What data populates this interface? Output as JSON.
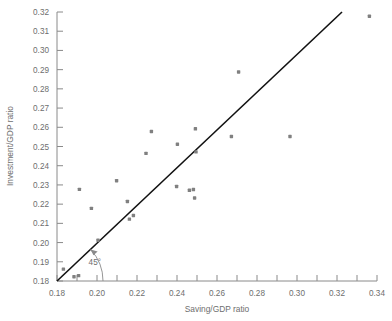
{
  "chart_data": {
    "type": "scatter",
    "title": "",
    "xlabel": "Saving/GDP ratio",
    "ylabel": "Investment/GDP ratio",
    "xlim": [
      0.18,
      0.34
    ],
    "ylim": [
      0.18,
      0.32
    ],
    "xticks": [
      0.18,
      0.19,
      0.2,
      0.21,
      0.22,
      0.23,
      0.24,
      0.25,
      0.26,
      0.27,
      0.28,
      0.29,
      0.3,
      0.31,
      0.32,
      0.33,
      0.34
    ],
    "xtick_labels": [
      "0.18",
      "",
      "0.20",
      "",
      "0.22",
      "",
      "0.24",
      "",
      "0.26",
      "",
      "0.28",
      "",
      "0.30",
      "",
      "0.32",
      "",
      "0.34"
    ],
    "yticks": [
      0.18,
      0.19,
      0.2,
      0.21,
      0.22,
      0.23,
      0.24,
      0.25,
      0.26,
      0.27,
      0.28,
      0.29,
      0.3,
      0.31,
      0.32
    ],
    "ytick_labels": [
      "0.18",
      "0.19",
      "0.20",
      "0.21",
      "0.22",
      "0.23",
      "0.24",
      "0.25",
      "0.26",
      "0.27",
      "0.28",
      "0.29",
      "0.30",
      "0.31",
      "0.32"
    ],
    "grid": false,
    "legend": "none",
    "marker_color": "#808080",
    "line_color": "#111111",
    "axis_color": "#8a8a8a",
    "points": [
      {
        "x": 0.1832,
        "y": 0.1862
      },
      {
        "x": 0.1885,
        "y": 0.1822
      },
      {
        "x": 0.1908,
        "y": 0.1828
      },
      {
        "x": 0.1912,
        "y": 0.2277
      },
      {
        "x": 0.1972,
        "y": 0.2178
      },
      {
        "x": 0.2005,
        "y": 0.2012
      },
      {
        "x": 0.2098,
        "y": 0.2322
      },
      {
        "x": 0.2152,
        "y": 0.2214
      },
      {
        "x": 0.2162,
        "y": 0.2122
      },
      {
        "x": 0.2182,
        "y": 0.2141
      },
      {
        "x": 0.2245,
        "y": 0.2464
      },
      {
        "x": 0.2272,
        "y": 0.2578
      },
      {
        "x": 0.2398,
        "y": 0.2292
      },
      {
        "x": 0.2402,
        "y": 0.2512
      },
      {
        "x": 0.2462,
        "y": 0.2272
      },
      {
        "x": 0.2482,
        "y": 0.2276
      },
      {
        "x": 0.2488,
        "y": 0.2232
      },
      {
        "x": 0.2492,
        "y": 0.2592
      },
      {
        "x": 0.2495,
        "y": 0.2472
      },
      {
        "x": 0.2672,
        "y": 0.2552
      },
      {
        "x": 0.2708,
        "y": 0.2888
      },
      {
        "x": 0.2965,
        "y": 0.2552
      },
      {
        "x": 0.3362,
        "y": 0.3178
      }
    ],
    "reference_line": {
      "label": "45°",
      "from": {
        "x": 0.18,
        "y": 0.18
      },
      "to": {
        "x": 0.3225,
        "y": 0.32
      }
    },
    "annotation": {
      "text": "45°",
      "x": 0.1928,
      "y": 0.1898
    }
  }
}
